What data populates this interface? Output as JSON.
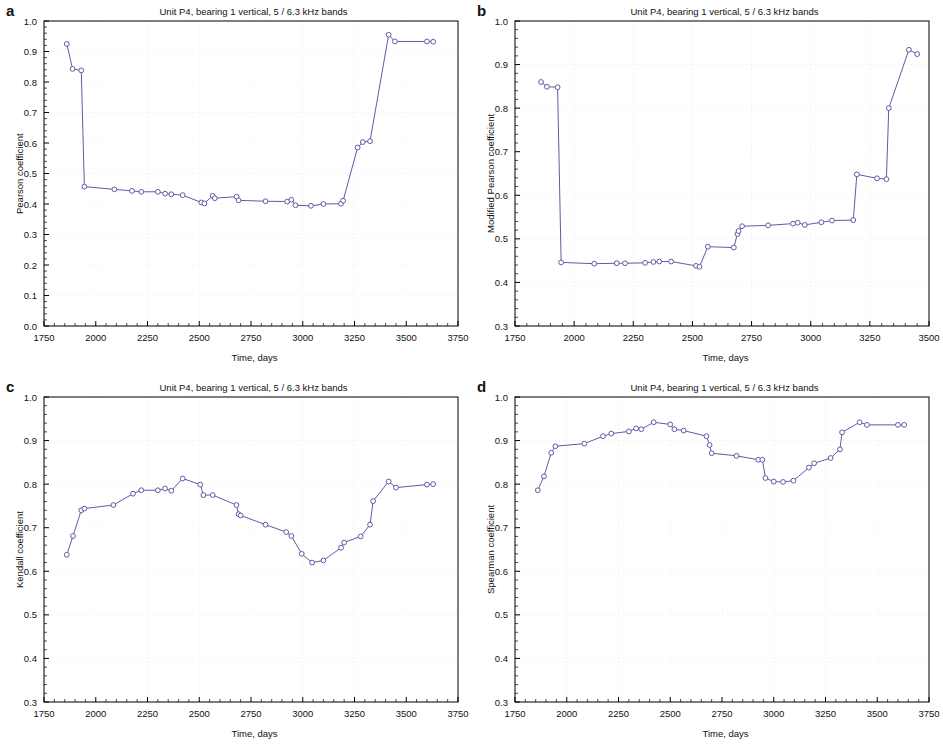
{
  "figure": {
    "background": "#ffffff",
    "series_color": "#5c5ca8",
    "marker_edge_color": "#5c5ca8",
    "marker_face_color": "#ffffff",
    "axis_color": "#000000",
    "grid_color": "#d8d8d8"
  },
  "panels": [
    {
      "letter": "a",
      "chart_data": {
        "type": "line",
        "title": "Unit P4, bearing 1 vertical, 5 / 6.3 kHz bands",
        "xlabel": "Time, days",
        "ylabel": "Pearson coefficient",
        "xlim": [
          1750,
          3750
        ],
        "ylim": [
          0.0,
          1.0
        ],
        "xticks": [
          1750,
          2000,
          2250,
          2500,
          2750,
          3000,
          3250,
          3500,
          3750
        ],
        "xticklabels": [
          "1750",
          "2000",
          "2250",
          "2500",
          "2750",
          "3000",
          "3250",
          "3500",
          "3750"
        ],
        "yticks": [
          0.0,
          0.1,
          0.2,
          0.3,
          0.4,
          0.5,
          0.6,
          0.7,
          0.8,
          0.9,
          1.0
        ],
        "yticklabels": [
          "0.0",
          "0.1",
          "0.2",
          "0.3",
          "0.4",
          "0.5",
          "0.6",
          "0.7",
          "0.8",
          "0.9",
          "1.0"
        ],
        "grid": true,
        "legend": "none",
        "marker": "open-circle",
        "series": [
          {
            "name": "Pearson coefficient",
            "x": [
              1860,
              1888,
              1930,
              1945,
              2090,
              2175,
              2220,
              2300,
              2335,
              2365,
              2420,
              2510,
              2525,
              2565,
              2575,
              2680,
              2690,
              2820,
              2925,
              2945,
              2965,
              3040,
              3100,
              3185,
              3195,
              3265,
              3290,
              3325,
              3415,
              3445,
              3600,
              3630
            ],
            "y": [
              0.925,
              0.843,
              0.838,
              0.457,
              0.448,
              0.443,
              0.44,
              0.44,
              0.434,
              0.432,
              0.429,
              0.405,
              0.402,
              0.427,
              0.419,
              0.424,
              0.412,
              0.409,
              0.408,
              0.414,
              0.396,
              0.394,
              0.4,
              0.401,
              0.411,
              0.585,
              0.603,
              0.606,
              0.955,
              0.933,
              0.933,
              0.932
            ]
          }
        ]
      }
    },
    {
      "letter": "b",
      "chart_data": {
        "type": "line",
        "title": "Unit P4, bearing 1 vertical, 5 / 6.3 kHz bands",
        "xlabel": "Time, days",
        "ylabel": "Modified Pearson coefficient",
        "xlim": [
          1750,
          3500
        ],
        "ylim": [
          0.3,
          1.0
        ],
        "xticks": [
          1750,
          2000,
          2250,
          2500,
          2750,
          3000,
          3250,
          3500
        ],
        "xticklabels": [
          "1750",
          "2000",
          "2250",
          "2500",
          "2750",
          "3000",
          "3250",
          "3500"
        ],
        "yticks": [
          0.3,
          0.4,
          0.5,
          0.6,
          0.7,
          0.8,
          0.9,
          1.0
        ],
        "yticklabels": [
          "0.3",
          "0.4",
          "0.5",
          "0.6",
          "0.7",
          "0.8",
          "0.9",
          "1.0"
        ],
        "grid": true,
        "legend": "none",
        "marker": "open-circle",
        "series": [
          {
            "name": "Modified Pearson coefficient",
            "x": [
              1860,
              1885,
              1930,
              1945,
              2085,
              2180,
              2215,
              2300,
              2335,
              2360,
              2410,
              2515,
              2530,
              2565,
              2675,
              2690,
              2695,
              2710,
              2820,
              2925,
              2945,
              2975,
              3045,
              3090,
              3180,
              3195,
              3280,
              3320,
              3330,
              3415,
              3450
            ],
            "y": [
              0.86,
              0.849,
              0.848,
              0.446,
              0.443,
              0.444,
              0.444,
              0.445,
              0.447,
              0.448,
              0.448,
              0.438,
              0.436,
              0.482,
              0.48,
              0.511,
              0.518,
              0.529,
              0.531,
              0.535,
              0.537,
              0.532,
              0.538,
              0.542,
              0.543,
              0.648,
              0.639,
              0.637,
              0.8,
              0.934,
              0.924
            ]
          }
        ]
      }
    },
    {
      "letter": "c",
      "chart_data": {
        "type": "line",
        "title": "Unit P4, bearing 1 vertical, 5 / 6.3 kHz bands",
        "xlabel": "Time, days",
        "ylabel": "Kendall coefficient",
        "xlim": [
          1750,
          3750
        ],
        "ylim": [
          0.3,
          1.0
        ],
        "xticks": [
          1750,
          2000,
          2250,
          2500,
          2750,
          3000,
          3250,
          3500,
          3750
        ],
        "xticklabels": [
          "1750",
          "2000",
          "2250",
          "2500",
          "2750",
          "3000",
          "3250",
          "3500",
          "3750"
        ],
        "yticks": [
          0.3,
          0.4,
          0.5,
          0.6,
          0.7,
          0.8,
          0.9,
          1.0
        ],
        "yticklabels": [
          "0.3",
          "0.4",
          "0.5",
          "0.6",
          "0.7",
          "0.8",
          "0.9",
          "1.0"
        ],
        "grid": true,
        "legend": "none",
        "marker": "open-circle",
        "series": [
          {
            "name": "Kendall coefficient",
            "x": [
              1860,
              1890,
              1930,
              1945,
              2085,
              2180,
              2220,
              2300,
              2335,
              2365,
              2420,
              2505,
              2520,
              2565,
              2680,
              2690,
              2700,
              2820,
              2920,
              2945,
              2995,
              3045,
              3100,
              3185,
              3200,
              3280,
              3325,
              3340,
              3415,
              3450,
              3600,
              3630
            ],
            "y": [
              0.638,
              0.681,
              0.74,
              0.744,
              0.752,
              0.778,
              0.786,
              0.786,
              0.79,
              0.785,
              0.813,
              0.799,
              0.775,
              0.775,
              0.752,
              0.731,
              0.728,
              0.707,
              0.69,
              0.681,
              0.64,
              0.62,
              0.625,
              0.654,
              0.666,
              0.68,
              0.707,
              0.761,
              0.806,
              0.792,
              0.799,
              0.8
            ]
          }
        ]
      }
    },
    {
      "letter": "d",
      "chart_data": {
        "type": "line",
        "title": "Unit P4, bearing 1 vertical, 5 / 6.3 kHz bands",
        "xlabel": "Time, days",
        "ylabel": "Spearman coefficient",
        "xlim": [
          1750,
          3750
        ],
        "ylim": [
          0.3,
          1.0
        ],
        "xticks": [
          1750,
          2000,
          2250,
          2500,
          2750,
          3000,
          3250,
          3500,
          3750
        ],
        "xticklabels": [
          "1750",
          "2000",
          "2250",
          "2500",
          "2750",
          "3000",
          "3250",
          "3500",
          "3750"
        ],
        "yticks": [
          0.3,
          0.4,
          0.5,
          0.6,
          0.7,
          0.8,
          0.9,
          1.0
        ],
        "yticklabels": [
          "0.3",
          "0.4",
          "0.5",
          "0.6",
          "0.7",
          "0.8",
          "0.9",
          "1.0"
        ],
        "grid": true,
        "legend": "none",
        "marker": "open-circle",
        "series": [
          {
            "name": "Spearman coefficient",
            "x": [
              1860,
              1890,
              1925,
              1945,
              2085,
              2175,
              2215,
              2300,
              2335,
              2360,
              2420,
              2500,
              2520,
              2565,
              2675,
              2690,
              2700,
              2820,
              2925,
              2945,
              2960,
              3000,
              3045,
              3095,
              3170,
              3195,
              3275,
              3320,
              3330,
              3415,
              3450,
              3600,
              3630
            ],
            "y": [
              0.786,
              0.818,
              0.872,
              0.887,
              0.893,
              0.91,
              0.916,
              0.921,
              0.928,
              0.926,
              0.942,
              0.937,
              0.926,
              0.923,
              0.91,
              0.89,
              0.871,
              0.865,
              0.856,
              0.856,
              0.814,
              0.806,
              0.805,
              0.808,
              0.838,
              0.848,
              0.86,
              0.88,
              0.919,
              0.942,
              0.936,
              0.936,
              0.936
            ]
          }
        ]
      }
    }
  ]
}
